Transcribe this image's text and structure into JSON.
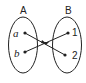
{
  "diagram": {
    "type": "mapping",
    "sets": [
      {
        "name": "A",
        "elements": [
          "a",
          "b"
        ]
      },
      {
        "name": "B",
        "elements": [
          "1",
          "2"
        ]
      }
    ],
    "mappings": [
      {
        "from": "a",
        "to": "2"
      },
      {
        "from": "b",
        "to": "1"
      }
    ],
    "colors": {
      "stroke": "#222222",
      "background": "#ffffff"
    }
  }
}
